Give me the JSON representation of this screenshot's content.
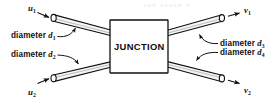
{
  "figure": {
    "background_color": "#ffffff",
    "stroke_color": "#111111",
    "pipe_fill_color": "#f4f4f4",
    "junction_fill_color": "#ffffff",
    "watermark_color": "#f2f2f2",
    "watermark_text": "••• ••••• •"
  },
  "junction": {
    "label": "JUNCTION"
  },
  "inlets": [
    {
      "flow_label": "u",
      "flow_sub": "1",
      "diameter_prefix": "diameter",
      "diameter_symbol": "d",
      "diameter_sub": "1",
      "position": "top-left"
    },
    {
      "flow_label": "u",
      "flow_sub": "2",
      "diameter_prefix": "diameter",
      "diameter_symbol": "d",
      "diameter_sub": "2",
      "position": "bottom-left"
    }
  ],
  "outlets": [
    {
      "flow_label": "v",
      "flow_sub": "1",
      "diameter_prefix": "diameter",
      "diameter_symbol": "d",
      "diameter_sub": "3",
      "position": "top-right"
    },
    {
      "flow_label": "v",
      "flow_sub": "2",
      "diameter_prefix": "diameter",
      "diameter_symbol": "d",
      "diameter_sub": "4",
      "position": "bottom-right"
    }
  ]
}
